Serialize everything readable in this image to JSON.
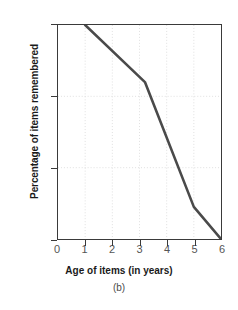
{
  "chart_data": {
    "type": "line",
    "title": "",
    "subtitle": "(b)",
    "xlabel": "Age of items (in years)",
    "ylabel": "Percentage of items remembered",
    "xlim": [
      0,
      6
    ],
    "ylim": [
      70,
      100
    ],
    "xticks": [
      0,
      1,
      2,
      3,
      4,
      5,
      6
    ],
    "xticklabels": [
      "0",
      "1",
      "2",
      "3",
      "4",
      "5",
      "6"
    ],
    "yticks": [
      70,
      80,
      90,
      100
    ],
    "yticklabels": [
      "70",
      "80",
      "90",
      "100"
    ],
    "grid": true,
    "grid_style": "dotted",
    "legend": "none",
    "series": [
      {
        "name": "Percentage of items remembered",
        "color": "#4a4a4a",
        "x": [
          1,
          3.2,
          5,
          6
        ],
        "y": [
          100,
          92,
          74.5,
          70
        ]
      }
    ]
  },
  "colors": {
    "line": "#4a4a4a",
    "axis": "#3a3a3a",
    "grid": "#d8d8d8",
    "tick_text": "#555555",
    "label_text": "#1a1a1a",
    "background": "#ffffff"
  }
}
